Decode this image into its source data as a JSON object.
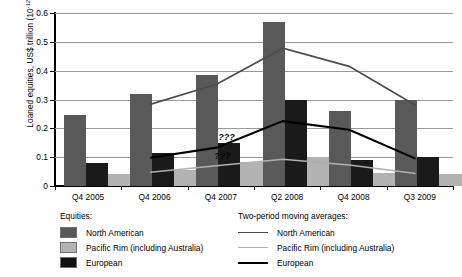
{
  "chart_data": {
    "type": "bar",
    "title": "",
    "xlabel": "",
    "ylabel": "Loaned equities, US$ trillion (10",
    "ylabel_exponent": "-12",
    "ylabel_suffix": ")",
    "categories": [
      "Q4 2005",
      "Q4 2006",
      "Q4 2007",
      "Q2 2008",
      "Q4 2008",
      "Q3 2009"
    ],
    "ylim": [
      0,
      0.6
    ],
    "ytick_labels": [
      "0",
      "0.1",
      "0.2",
      "0.3",
      "0.4",
      "0.5",
      "0.6"
    ],
    "ytick_values": [
      0,
      0.1,
      0.2,
      0.3,
      0.4,
      0.5,
      0.6
    ],
    "grid": true,
    "legend_position": "bottom",
    "series": [
      {
        "name": "North American",
        "type": "bar",
        "color": "#595959",
        "values": [
          0.245,
          0.32,
          0.385,
          0.57,
          0.26,
          0.3
        ]
      },
      {
        "name": "European",
        "type": "bar",
        "color": "#1a1a1a",
        "values": [
          0.08,
          0.115,
          0.15,
          0.3,
          0.09,
          0.1
        ]
      },
      {
        "name": "Pacific Rim (including Australia)",
        "type": "bar",
        "color": "#b3b3b3",
        "values": [
          0.04,
          0.055,
          0.085,
          0.1,
          0.045,
          0.04
        ]
      },
      {
        "name": "North American",
        "type": "line",
        "subtitle": "Two-period moving average",
        "color": "#4d4d4d",
        "values": [
          null,
          0.283,
          0.353,
          0.478,
          0.415,
          0.28
        ]
      },
      {
        "name": "European",
        "type": "line",
        "subtitle": "Two-period moving average",
        "color": "#000000",
        "values": [
          null,
          0.098,
          0.133,
          0.225,
          0.195,
          0.095
        ]
      },
      {
        "name": "Pacific Rim (including Australia)",
        "type": "line",
        "subtitle": "Two-period moving average",
        "color": "#b0b0b0",
        "values": [
          null,
          0.048,
          0.07,
          0.093,
          0.073,
          0.043
        ]
      }
    ],
    "annotations": [
      {
        "text": "???",
        "x": 0.41,
        "y": 0.148
      },
      {
        "text": "???",
        "x": 0.4,
        "y": 0.083
      }
    ]
  },
  "legend": {
    "bars": {
      "title": "Equities:",
      "items": [
        {
          "label": "North American",
          "color": "#595959"
        },
        {
          "label": "Pacific Rim (including Australia)",
          "color": "#b3b3b3"
        },
        {
          "label": "European",
          "color": "#111111"
        }
      ]
    },
    "lines": {
      "title": "Two-period moving averages:",
      "items": [
        {
          "label": "North American",
          "color": "#4d4d4d"
        },
        {
          "label": "Pacific Rim (including Australia)",
          "color": "#b0b0b0"
        },
        {
          "label": "European",
          "color": "#000000"
        }
      ]
    }
  }
}
